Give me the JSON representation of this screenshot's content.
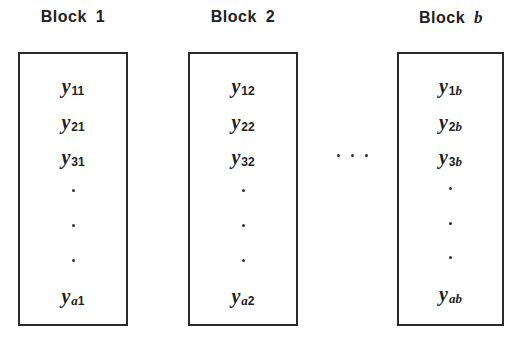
{
  "diagram": {
    "type": "randomized-block-layout",
    "blocks": [
      {
        "title_word": "Block",
        "title_index": "1",
        "index_italic": false,
        "cells": [
          {
            "symbol": "y",
            "subscript": "11"
          },
          {
            "symbol": "y",
            "subscript": "21"
          },
          {
            "symbol": "y",
            "subscript": "31"
          },
          {
            "symbol": "y",
            "subscript_var": "a",
            "subscript": "1"
          }
        ]
      },
      {
        "title_word": "Block",
        "title_index": "2",
        "index_italic": false,
        "cells": [
          {
            "symbol": "y",
            "subscript": "12"
          },
          {
            "symbol": "y",
            "subscript": "22"
          },
          {
            "symbol": "y",
            "subscript": "32"
          },
          {
            "symbol": "y",
            "subscript_var": "a",
            "subscript": "2"
          }
        ]
      },
      {
        "title_word": "Block",
        "title_index": "b",
        "index_italic": true,
        "cells": [
          {
            "symbol": "y",
            "subscript": "1",
            "subscript_var": "b"
          },
          {
            "symbol": "y",
            "subscript": "2",
            "subscript_var": "b"
          },
          {
            "symbol": "y",
            "subscript": "3",
            "subscript_var": "b"
          },
          {
            "symbol": "y",
            "subscript_var": "ab"
          }
        ]
      }
    ],
    "vertical_ellipsis": "⋮",
    "horizontal_ellipsis": "· · ·",
    "colors": {
      "stroke": "#2a2a2a",
      "text": "#222222",
      "background": "#ffffff"
    }
  }
}
